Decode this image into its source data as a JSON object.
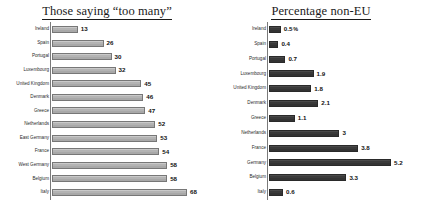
{
  "chart_data": [
    {
      "type": "bar",
      "title": "Those saying “too many”",
      "orientation": "horizontal",
      "xlabel": "",
      "ylabel": "",
      "grid": false,
      "legend": "none",
      "xlim": [
        0,
        68
      ],
      "bar_color": "#b3b3b3",
      "categories": [
        "Ireland",
        "Spain",
        "Portugal",
        "Luxembourg",
        "United Kingdom",
        "Denmark",
        "Greece",
        "Netherlands",
        "East Germany",
        "France",
        "West Germany",
        "Belgium",
        "Italy"
      ],
      "values": [
        13,
        26,
        30,
        32,
        45,
        46,
        47,
        52,
        53,
        54,
        58,
        58,
        68
      ],
      "value_labels": [
        "13",
        "26",
        "30",
        "32",
        "45",
        "46",
        "47",
        "52",
        "53",
        "54",
        "58",
        "58",
        "68"
      ]
    },
    {
      "type": "bar",
      "title": "Percentage non-EU",
      "orientation": "horizontal",
      "xlabel": "",
      "ylabel": "",
      "grid": false,
      "legend": "none",
      "xlim": [
        0,
        5.2
      ],
      "bar_color": "#3a3a3a",
      "unit": "%",
      "categories": [
        "Ireland",
        "Spain",
        "Portugal",
        "Luxembourg",
        "United Kingdom",
        "Denmark",
        "Greece",
        "Netherlands",
        "France",
        "Germany",
        "Belgium",
        "Italy"
      ],
      "values": [
        0.5,
        0.4,
        0.7,
        1.9,
        1.8,
        2.1,
        1.1,
        3,
        3.8,
        5.2,
        3.3,
        0.6
      ],
      "value_labels": [
        "0.5",
        "0.4",
        "0.7",
        "1.9",
        "1.8",
        "2.1",
        "1.1",
        "3",
        "3.8",
        "5.2",
        "3.3",
        "0.6"
      ],
      "unit_on_first_row": "%"
    }
  ]
}
